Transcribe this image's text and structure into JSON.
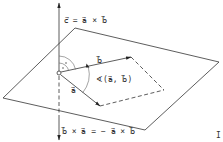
{
  "diagram": {
    "labels": {
      "c_eq": "c⃗ = a⃗ × b⃗",
      "vec_b": "b⃗",
      "vec_a": "a⃗",
      "angle": "∢(a⃗, b⃗)",
      "anti": "b⃗ × a⃗ = − a⃗ × b⃗",
      "corner_mark": "I"
    },
    "geometry": {
      "origin": [
        59,
        73
      ],
      "axis_top": [
        59,
        2
      ],
      "axis_bottom": [
        59,
        140
      ],
      "plane": [
        [
          75,
          28
        ],
        [
          219,
          62
        ],
        [
          145,
          130
        ],
        [
          3,
          98
        ]
      ],
      "b_tip": [
        131,
        57
      ],
      "a_tip": [
        100,
        106
      ],
      "parallelogram_far": [
        164,
        90
      ]
    },
    "colors": {
      "stroke": "#333333",
      "background": "#ffffff"
    }
  }
}
